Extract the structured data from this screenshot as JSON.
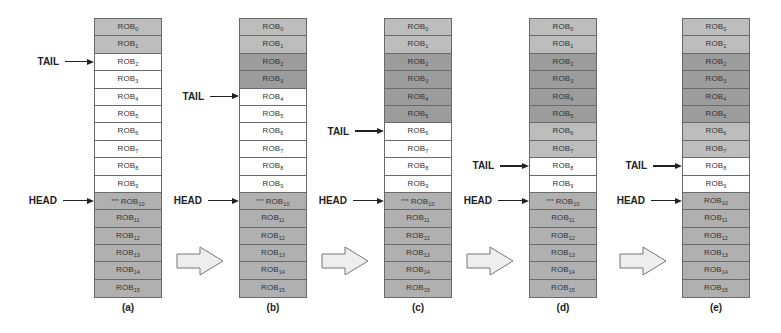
{
  "diagram": {
    "labels": {
      "tail": "TAIL",
      "head": "HEAD",
      "entry_prefix": "ROB",
      "head_marker": "***"
    },
    "colors": {
      "free": "#ffffff",
      "light": "#bdbdbd",
      "dark": "#9c9c9c",
      "occupied": "#b0b0b0",
      "border": "#6a6a6a",
      "arrow_fill": "#eeeeee"
    },
    "panels": [
      {
        "id": "a",
        "caption": "(a)",
        "x": 94,
        "tail": 2,
        "head": 10,
        "head_marked": true,
        "states": [
          "light",
          "light",
          "white",
          "white",
          "white",
          "white",
          "white",
          "white",
          "white",
          "white",
          "mid",
          "mid",
          "mid",
          "mid",
          "mid",
          "mid"
        ]
      },
      {
        "id": "b",
        "caption": "(b)",
        "x": 239,
        "tail": 4,
        "head": 10,
        "head_marked": true,
        "states": [
          "light",
          "light",
          "dark",
          "dark",
          "white",
          "white",
          "white",
          "white",
          "white",
          "white",
          "mid",
          "mid",
          "mid",
          "mid",
          "mid",
          "mid"
        ]
      },
      {
        "id": "c",
        "caption": "(c)",
        "x": 384,
        "tail": 6,
        "head": 10,
        "head_marked": true,
        "states": [
          "light",
          "light",
          "dark",
          "dark",
          "dark",
          "dark",
          "white",
          "white",
          "white",
          "white",
          "mid",
          "mid",
          "mid",
          "mid",
          "mid",
          "mid"
        ]
      },
      {
        "id": "d",
        "caption": "(d)",
        "x": 529,
        "tail": 8,
        "head": 10,
        "head_marked": true,
        "states": [
          "light",
          "light",
          "dark",
          "dark",
          "dark",
          "dark",
          "light",
          "light",
          "white",
          "white",
          "mid",
          "mid",
          "mid",
          "mid",
          "mid",
          "mid"
        ]
      },
      {
        "id": "e",
        "caption": "(e)",
        "x": 682,
        "tail": 8,
        "head": 10,
        "head_marked": false,
        "states": [
          "light",
          "light",
          "dark",
          "dark",
          "dark",
          "dark",
          "light",
          "light",
          "white",
          "white",
          "mid",
          "mid",
          "mid",
          "mid",
          "mid",
          "mid"
        ]
      }
    ],
    "transition_arrows_x": [
      176,
      321,
      466,
      619
    ]
  }
}
